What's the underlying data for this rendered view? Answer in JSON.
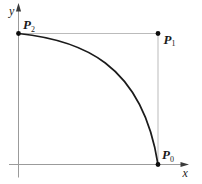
{
  "figure": {
    "y_axis_label": "y",
    "x_axis_label": "x",
    "points": {
      "p2": {
        "base": "P",
        "sub": "2"
      },
      "p1": {
        "base": "P",
        "sub": "1"
      },
      "p0": {
        "base": "P",
        "sub": "0"
      }
    },
    "colors": {
      "background": "#ffffff",
      "axis": "#9b9b9b",
      "guide": "#bbbbbb",
      "curve": "#1b1b1b",
      "dot": "#0d0d0d",
      "arrow": "#3a3a3a",
      "label": "#1b1b1b"
    }
  }
}
